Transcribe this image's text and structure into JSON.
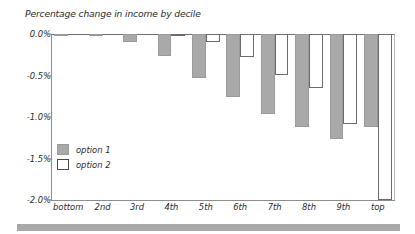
{
  "chart_data": {
    "type": "bar",
    "title": "Percentage change in income by decile",
    "xlabel": "",
    "ylabel": "",
    "ylim": [
      -2.0,
      0.0
    ],
    "yticks": [
      0.0,
      -0.5,
      -1.0,
      -1.5,
      -2.0
    ],
    "ytick_labels": [
      "0.0%",
      "-0.5%",
      "-1.0%",
      "-1.5%",
      "-2.0%"
    ],
    "grid": false,
    "legend_position": "inside-left-lower",
    "categories": [
      "bottom",
      "2nd",
      "3rd",
      "4th",
      "5th",
      "6th",
      "7th",
      "8th",
      "9th",
      "top"
    ],
    "series": [
      {
        "name": "option 1",
        "color": "#a9a9a9",
        "values": [
          -0.01,
          -0.03,
          -0.1,
          -0.27,
          -0.53,
          -0.76,
          -0.96,
          -1.12,
          -1.26,
          -1.12
        ]
      },
      {
        "name": "option 2",
        "color": "#ffffff",
        "values": [
          0.0,
          0.0,
          0.0,
          -0.02,
          -0.1,
          -0.28,
          -0.49,
          -0.65,
          -1.09,
          -2.0
        ]
      }
    ]
  },
  "legend": {
    "entries": [
      {
        "label": "option 1"
      },
      {
        "label": "option 2"
      }
    ]
  },
  "colors": {
    "bar_fill": "#a9a9a9",
    "bar_outline": "#6b6b6b",
    "axis": "#8d8d8d",
    "text": "#2b2b2b",
    "footer_band": "#a9a9a9"
  }
}
